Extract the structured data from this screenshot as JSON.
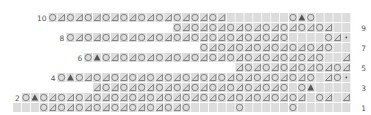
{
  "chart": {
    "row_labels_right": [
      "9",
      "7",
      "5",
      "3",
      "1"
    ],
    "row_labels_left": [
      "10",
      "8",
      "6",
      "4",
      "2"
    ],
    "legend_symbols": {
      "O": "yarn over (circle)",
      "T": "ssk/decrease (triangle outline)",
      "A": "double decrease (filled triangle)",
      "*": "purl dot",
      "_": "knit (blank cell)"
    },
    "colors": {
      "cell": "#dcdcdc",
      "symbol": "#777777",
      "filled": "#555555",
      "label": "#555555"
    },
    "grid": {
      "cols": 38,
      "rows": 10,
      "pitch_x": 8.9,
      "pitch_y": 10,
      "origin_x": 13,
      "origin_y": 13
    },
    "rows": [
      {
        "n": 10,
        "start": 4,
        "cells": "OTOTOTOTOTOTOTOTOTOT_______OAO_____OT*****"
      },
      {
        "n": 9,
        "start": 18,
        "cells": "OTOTOTOTOTOTOTOTOT__OT__TO_OT______"
      },
      {
        "n": 8,
        "start": 6,
        "cells": "OTOTOTOTOTOTOTOTOTOTOTOTO____OT*******"
      },
      {
        "n": 7,
        "start": 21,
        "cells": "OTOTOTOTOTOTOTO___O____O_______"
      },
      {
        "n": 6,
        "start": 8,
        "cells": "OAOTOTOTOTOTOTOTOTOTOTOTOTO__TO_OT*******"
      },
      {
        "n": 5,
        "start": 25,
        "cells": "TOTOTOTOTOTOTOAOAO___T______"
      },
      {
        "n": 4,
        "start": 5,
        "cells": "OAOTOTOTOTOTOTOTOTOTOTOTOTOTO_TO*********"
      },
      {
        "n": 3,
        "start": 9,
        "cells": "TOTOTOTOTOTOTOTOTOTOTO_OA______"
      },
      {
        "n": 2,
        "start": 1,
        "cells": "OAOTOTOTOTOTOTOTOTOTOTOTOTOTOTOT_OT_TO*******"
      },
      {
        "n": 1,
        "start": 0,
        "cells": "___OTOTOTOTOTOTOTOTO_____O_____O_______"
      }
    ]
  }
}
